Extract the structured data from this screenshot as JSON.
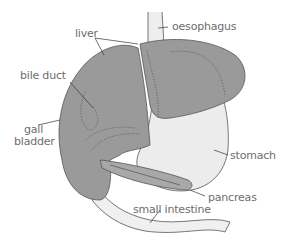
{
  "title": "The digestive system: liver, gall bladder and pancreas",
  "labels": {
    "oesophagus": "oesophagus",
    "liver": "liver",
    "bile_duct": "bile duct",
    "gall_bladder_1": "gall",
    "gall_bladder_2": "bladder",
    "stomach": "stomach",
    "pancreas": "pancreas",
    "small_intestine": "small intestine"
  },
  "colors": {
    "liver": "#9a9a9a",
    "stomach": "#ececec",
    "oesophagus": "#eeeeee",
    "intestine": "#f0f0f0",
    "pancreas": "#a8a8a8",
    "outline": "#555555",
    "label": "#6d6d6d"
  }
}
